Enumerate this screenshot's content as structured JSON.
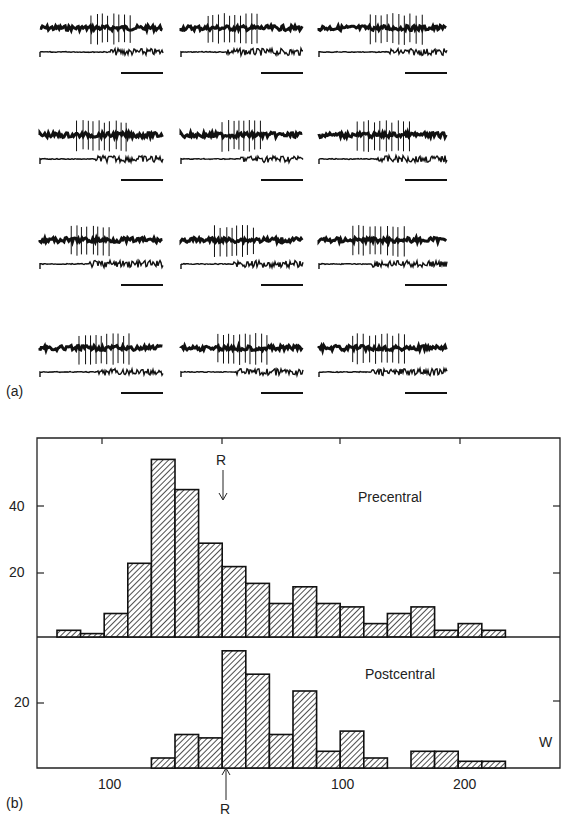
{
  "panel_a": {
    "label": "(a)",
    "rows": 4,
    "cols": 3,
    "description": "Paired recordings: upper trace unit spikes, lower trace EMG; horizontal scale bar under each pair"
  },
  "panel_b": {
    "label": "(b)",
    "precentral_label": "Precentral",
    "postcentral_label": "Postcentral",
    "r_marker": "R",
    "w_marker": "W",
    "y_ticks_top": [
      "40",
      "20"
    ],
    "y_ticks_bottom": [
      "20"
    ],
    "x_tick_labels": [
      "100",
      "100",
      "200"
    ]
  },
  "chart_data": [
    {
      "type": "bar",
      "title": "Precentral",
      "xlabel": "",
      "ylabel": "",
      "ylim": [
        0,
        60
      ],
      "y_ticks": [
        20,
        40
      ],
      "bin_count": 19,
      "values": [
        2,
        1,
        7,
        22,
        53,
        44,
        28,
        21,
        16,
        10,
        15,
        10,
        9,
        4,
        7,
        9,
        2,
        4,
        2
      ],
      "annotations": [
        {
          "text": "R",
          "arrow": "down",
          "bin_index": 7
        }
      ],
      "grid": false,
      "pattern": "diagonal-hatch"
    },
    {
      "type": "bar",
      "title": "Postcentral",
      "xlabel": "",
      "ylabel": "",
      "ylim": [
        0,
        37
      ],
      "y_ticks": [
        20
      ],
      "bin_count": 19,
      "values": [
        0,
        0,
        0,
        0,
        3,
        10,
        9,
        35,
        28,
        10,
        23,
        5,
        11,
        3,
        0,
        5,
        5,
        2,
        2
      ],
      "x_tick_labels": [
        "100",
        "100",
        "200"
      ],
      "annotations": [
        {
          "text": "R",
          "arrow": "up",
          "bin_index": 7
        },
        {
          "text": "W",
          "position": "right"
        }
      ],
      "grid": false,
      "pattern": "diagonal-hatch"
    }
  ]
}
